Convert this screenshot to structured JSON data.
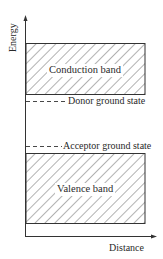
{
  "diagram": {
    "title": "",
    "axes": {
      "y_label": "Energy",
      "x_label": "Distance"
    },
    "bands": [
      {
        "id": "conduction",
        "label": "Conduction band",
        "fill": "hatched"
      },
      {
        "id": "valence",
        "label": "Valence band",
        "fill": "hatched"
      }
    ],
    "levels": [
      {
        "id": "donor",
        "label": "Donor ground state",
        "style": "dashed"
      },
      {
        "id": "acceptor",
        "label": "Acceptor ground state",
        "style": "dashed"
      }
    ],
    "colors": {
      "line": "#333333",
      "hatch": "#555555",
      "background": "#ffffff"
    }
  }
}
